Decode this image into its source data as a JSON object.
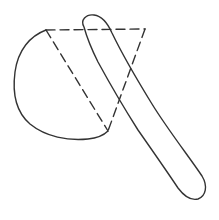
{
  "drawing": {
    "subject": "axe sketch",
    "background_color": "#ffffff",
    "stroke_color": "#333333",
    "stroke_width": 1.4,
    "dash_pattern": "9 5",
    "parts": {
      "blade_arc": {
        "path": "M46,30 C30,36 18,50 15,72 C12,95 16,112 30,124 C46,137 68,141 88,139 C98,138 104,135 108,131"
      },
      "blade_dashed_top": {
        "path": "M46,30 L145,29"
      },
      "blade_dashed_left": {
        "path": "M46,30 L108,131"
      },
      "blade_dashed_right": {
        "path": "M145,29 L108,131"
      },
      "handle": {
        "path": "M84,27 C80,20 86,14 94,15 C102,16 108,24 112,33 C124,58 136,78 152,104 C168,130 190,158 202,176 C208,186 206,196 198,199 C190,201 184,196 178,188 C166,170 152,150 138,130 C124,108 110,84 98,62 C92,50 87,38 84,27 Z"
      }
    }
  }
}
